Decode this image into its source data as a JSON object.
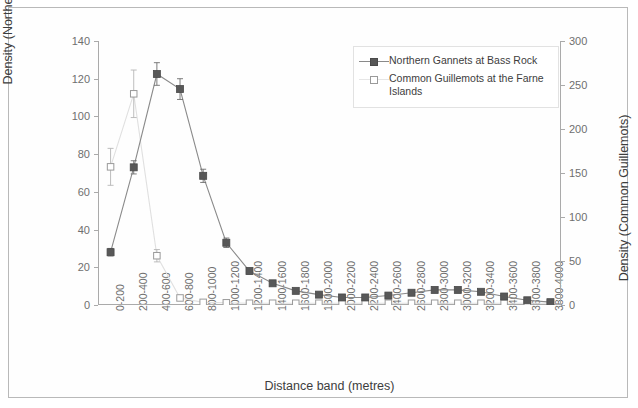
{
  "chart_data": {
    "type": "line",
    "title": "",
    "xlabel": "Distance band (metres)",
    "ylabel": "Density (Northern Gannets)",
    "ylabel_secondary": "Density (Common Guillemots)",
    "ylim": [
      0,
      140
    ],
    "ylim_secondary": [
      0,
      300
    ],
    "yticks": [
      0,
      20,
      40,
      60,
      80,
      100,
      120,
      140
    ],
    "yticks_secondary": [
      0,
      50,
      100,
      150,
      200,
      250,
      300
    ],
    "grid": false,
    "legend_position": "top-right-inside",
    "categories": [
      "0-200",
      "200-400",
      "400-600",
      "600-800",
      "800-1000",
      "1000-1200",
      "1200-1400",
      "1400-1600",
      "1600-1800",
      "1800-2000",
      "2000-2200",
      "2200-2400",
      "2400-2600",
      "2600-2800",
      "2800-3000",
      "3000-3200",
      "3200-3400",
      "3400-3600",
      "3600-3800",
      "3800-4000"
    ],
    "series": [
      {
        "name": "Northern Gannets at Bass Rock",
        "axis": "left",
        "marker": "filled-square",
        "color": "#585858",
        "line_color": "#8a8a8a",
        "values": [
          28,
          73,
          122.5,
          114.5,
          68.5,
          33,
          18,
          11.5,
          7.5,
          5.5,
          4,
          4,
          5,
          6.5,
          8,
          8,
          7,
          4.5,
          2.5,
          1.5
        ],
        "errors": [
          2,
          3.5,
          6,
          5.5,
          3.5,
          2.5,
          1.5,
          1.2,
          1,
          0.9,
          0.8,
          0.8,
          0.9,
          1,
          1.1,
          1.1,
          1,
          0.8,
          0.6,
          0.5
        ]
      },
      {
        "name": "Common Guillemots at the Farne Islands",
        "axis": "right",
        "marker": "open-square",
        "color": "#ffffff",
        "line_color": "#e0e0e0",
        "values": [
          157,
          240,
          56,
          8,
          3,
          2.5,
          2,
          2,
          2,
          2,
          2,
          2,
          2,
          2,
          2,
          2,
          2,
          2,
          2,
          2
        ],
        "errors": [
          21,
          27,
          7,
          2,
          1,
          1,
          0.8,
          0.8,
          0.8,
          0.8,
          0.8,
          0.8,
          0.8,
          0.8,
          0.8,
          0.8,
          0.8,
          0.8,
          0.8,
          0.8
        ]
      }
    ],
    "legend": [
      "Northern Gannets at Bass Rock",
      "Common Guillemots at the Farne Islands"
    ]
  },
  "legend": {
    "items": [
      {
        "label": "Northern Gannets at Bass Rock"
      },
      {
        "label": "Common Guillemots at the Farne Islands"
      }
    ]
  }
}
